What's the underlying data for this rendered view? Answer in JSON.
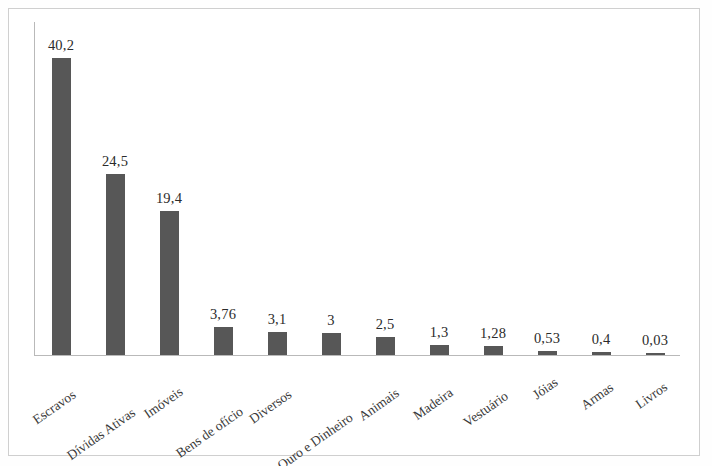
{
  "figure": {
    "background_color": "#ffffff",
    "frame_color": "#cfcfcf",
    "bar_color": "#575757",
    "axis_color": "#b9b9b9",
    "label_color": "#2b2b2b"
  },
  "chart_data": {
    "type": "bar",
    "title": "",
    "subtitle": "",
    "xlabel": "",
    "ylabel": "",
    "grid": false,
    "legend": "none",
    "decimal_separator": ",",
    "ylim": [
      0,
      45
    ],
    "categories": [
      "Escravos",
      "Dívidas Ativas",
      "Imóveis",
      "Bens de ofício",
      "Diversos",
      "Ouro e Dinheiro",
      "Animais",
      "Madeira",
      "Vestuário",
      "Jóias",
      "Armas",
      "Livros"
    ],
    "values": [
      40.2,
      24.5,
      19.4,
      3.76,
      3.1,
      3,
      2.5,
      1.3,
      1.28,
      0.53,
      0.4,
      0.03
    ],
    "value_labels": [
      "40,2",
      "24,5",
      "19,4",
      "3,76",
      "3,1",
      "3",
      "2,5",
      "1,3",
      "1,28",
      "0,53",
      "0,4",
      "0,03"
    ]
  }
}
